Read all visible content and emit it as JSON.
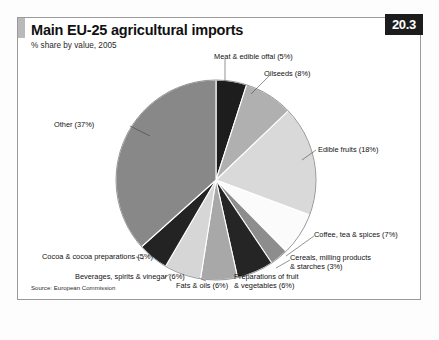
{
  "header": {
    "title": "Main EU-25 agricultural imports",
    "subtitle": "% share by value, 2005",
    "badge": "20.3"
  },
  "footer": {
    "source": "Source: European Commission"
  },
  "chart_data": {
    "type": "pie",
    "title": "Main EU-25 agricultural imports",
    "subtitle": "% share by value, 2005",
    "unit": "%",
    "value_basis": "share by value",
    "year": 2005,
    "total": 100,
    "start_angle_deg": 0,
    "direction": "clockwise",
    "legend": "labels with leader lines around pie",
    "grid": false,
    "categories": [
      "Meat & edible offal",
      "Oilseeds",
      "Edible fruits",
      "Coffee, tea & spices",
      "Cereals, milling products & starches",
      "Preparations of fruit & vegetables",
      "Fats & oils",
      "Beverages, spirits & vinegar",
      "Cocoa & cocoa preparations",
      "Other"
    ],
    "values": [
      5,
      8,
      18,
      7,
      3,
      6,
      6,
      6,
      5,
      37
    ],
    "slices": [
      {
        "label": "Meat & edible offal (5%)",
        "name": "Meat & edible offal",
        "value": 5,
        "color": "#1d1d1d"
      },
      {
        "label": "Oilseeds (8%)",
        "name": "Oilseeds",
        "value": 8,
        "color": "#b0b0b0"
      },
      {
        "label": "Edible fruits (18%)",
        "name": "Edible fruits",
        "value": 18,
        "color": "#d9d9d9"
      },
      {
        "label": "Coffee, tea & spices (7%)",
        "name": "Coffee, tea & spices",
        "value": 7,
        "color": "#fbfbfb"
      },
      {
        "label": "Cereals, milling products\n& starches (3%)",
        "name": "Cereals, milling products & starches",
        "value": 3,
        "color": "#8d8d8d"
      },
      {
        "label": "Preparations of fruit\n& vegetables (6%)",
        "name": "Preparations of fruit & vegetables",
        "value": 6,
        "color": "#252525"
      },
      {
        "label": "Fats & oils (6%)",
        "name": "Fats & oils",
        "value": 6,
        "color": "#a8a8a8"
      },
      {
        "label": "Beverages, spirits & vinegar (6%)",
        "name": "Beverages, spirits & vinegar",
        "value": 6,
        "color": "#d6d6d6"
      },
      {
        "label": "Cocoa & cocoa preparations (5%)",
        "name": "Cocoa & cocoa preparations",
        "value": 5,
        "color": "#232323"
      },
      {
        "label": "Other (37%)",
        "name": "Other",
        "value": 37,
        "color": "#888888"
      }
    ]
  },
  "labels": {
    "meat": "Meat & edible offal (5%)",
    "oilseeds": "Oilseeds (8%)",
    "edible_fruits": "Edible fruits (18%)",
    "coffee": "Coffee, tea & spices (7%)",
    "cereals_l1": "Cereals, milling products",
    "cereals_l2": "& starches (3%)",
    "prep_l1": "Preparations of fruit",
    "prep_l2": "& vegetables (6%)",
    "fats": "Fats & oils (6%)",
    "beverages": "Beverages, spirits & vinegar (6%)",
    "cocoa": "Cocoa & cocoa preparations (5%)",
    "other": "Other (37%)"
  }
}
